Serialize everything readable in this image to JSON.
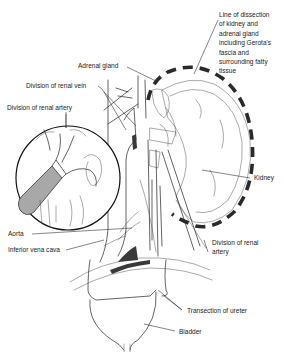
{
  "figure": {
    "labels": {
      "line_of_dissection": "Line of dissection\nof kidney and\nadrenal gland\nincluding Gerota's\nfascia and\nsurrounding fatty\ntissue",
      "adrenal_gland": "Adrenal gland",
      "division_renal_vein": "Division of renal vein",
      "division_renal_artery_left": "Division of renal artery",
      "kidney": "Kidney",
      "aorta": "Aorta",
      "inferior_vena_cava": "Inferior vena cava",
      "division_renal_artery_right": "Division of renal\nartery",
      "transection_ureter": "Transection of ureter",
      "bladder": "Bladder"
    },
    "colors": {
      "line": "#222222",
      "dashed_outline": "#2a2a2a",
      "instrument_fill": "#a8a8a8",
      "background": "#ffffff"
    }
  }
}
